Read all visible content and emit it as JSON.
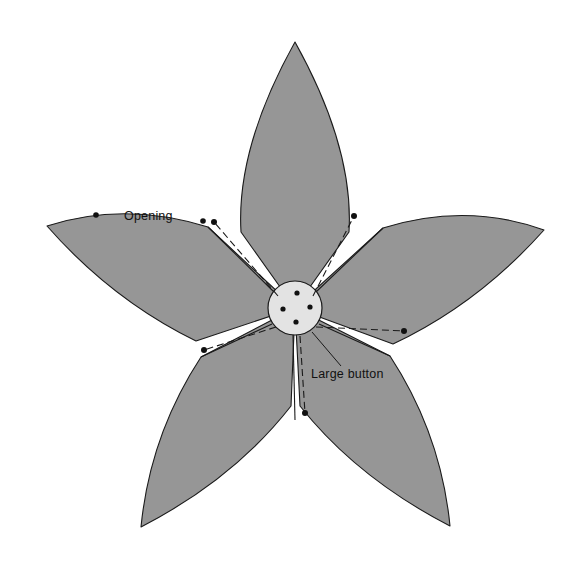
{
  "figure": {
    "background_color": "#ffffff",
    "width": 588,
    "height": 569
  },
  "colors": {
    "petal_fill": "#969696",
    "petal_stroke": "#1a1a1a",
    "hub_fill": "#e3e3e3",
    "hub_stroke": "#1a1a1a",
    "dot_fill": "#111111",
    "text": "#111111"
  },
  "annotations": [
    {
      "id": "opening",
      "label": "Opening",
      "x": 124,
      "y": 220,
      "anchor": "start"
    },
    {
      "id": "large-button",
      "label": "Large button",
      "x": 311,
      "y": 378,
      "anchor": "start"
    }
  ],
  "hub": {
    "name": "Large button",
    "center_x": 295,
    "center_y": 308,
    "radius": 27,
    "holes": [
      {
        "x": 297,
        "y": 293
      },
      {
        "x": 283,
        "y": 309
      },
      {
        "x": 310,
        "y": 307
      },
      {
        "x": 296,
        "y": 322
      }
    ]
  },
  "petals": [
    {
      "id": "petal-top",
      "name": "top-petal",
      "path": "M 295 308 L 241 232 Q 236 148 295 42 Q 354 148 349 232 Z"
    },
    {
      "id": "petal-upper-left",
      "name": "upper-left-petal",
      "path": "M 295 308 L 208 227 Q 124 201 47 226 Q 112 300 196 341 Z"
    },
    {
      "id": "petal-upper-right",
      "name": "upper-right-petal",
      "path": "M 295 308 L 383 228 Q 466 202 544 230 Q 478 304 393 344 Z"
    },
    {
      "id": "petal-lower-left",
      "name": "lower-left-petal",
      "path": "M 295 308 L 201 357 Q 150 435 141 527 Q 234 479 291 406 Z"
    },
    {
      "id": "petal-lower-right",
      "name": "lower-right-petal",
      "path": "M 295 308 L 390 356 Q 441 434 450 526 Q 357 478 300 406 Z"
    }
  ],
  "spokes": [
    {
      "id": "spoke-upper-left",
      "x1": 274,
      "y1": 292,
      "x2": 208,
      "y2": 227
    },
    {
      "id": "spoke-upper-right",
      "x1": 316,
      "y1": 292,
      "x2": 383,
      "y2": 228
    },
    {
      "id": "spoke-lower-left",
      "x1": 272,
      "y1": 324,
      "x2": 201,
      "y2": 357
    },
    {
      "id": "spoke-lower-right",
      "x1": 319,
      "y1": 324,
      "x2": 390,
      "y2": 356
    },
    {
      "id": "spoke-bottom",
      "x1": 293,
      "y1": 335,
      "x2": 295,
      "y2": 420
    }
  ],
  "dashed_arrows": [
    {
      "id": "arrow-upper-left",
      "x1": 278,
      "y1": 296,
      "x2": 214,
      "y2": 222,
      "tip_x": 214,
      "tip_y": 222
    },
    {
      "id": "arrow-upper-right",
      "x1": 313,
      "y1": 296,
      "x2": 354,
      "y2": 216,
      "tip_x": 354,
      "tip_y": 216
    },
    {
      "id": "arrow-lower-left",
      "x1": 276,
      "y1": 327,
      "x2": 204,
      "y2": 350,
      "tip_x": 204,
      "tip_y": 350
    },
    {
      "id": "arrow-lower-right",
      "x1": 316,
      "y1": 327,
      "x2": 404,
      "y2": 331,
      "tip_x": 404,
      "tip_y": 331
    },
    {
      "id": "arrow-bottom",
      "x1": 300,
      "y1": 336,
      "x2": 305,
      "y2": 413,
      "tip_x": 305,
      "tip_y": 413
    }
  ],
  "opening_dots": [
    {
      "id": "opening-dot-left",
      "x": 96,
      "y": 215
    },
    {
      "id": "opening-dot-right",
      "x": 203,
      "y": 221
    }
  ],
  "leader": {
    "id": "large-button-leader",
    "x1": 312,
    "y1": 332,
    "x2": 341,
    "y2": 366
  }
}
